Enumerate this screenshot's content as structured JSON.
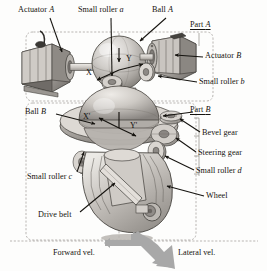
{
  "figure": {
    "type": "mechanical-assembly-diagram",
    "background_color": "#fdfdfc",
    "line_color": "#15130f"
  },
  "labels": {
    "actuator_a": {
      "text": "Actuator ",
      "em": "A",
      "x": 18,
      "y": 6
    },
    "small_roller_a": {
      "text": "Small roller ",
      "em": "a",
      "x": 78,
      "y": 6
    },
    "ball_a": {
      "text": "Ball ",
      "em": "A",
      "x": 152,
      "y": 6
    },
    "part_a": {
      "text": "Part ",
      "em": "A",
      "x": 190,
      "y": 25
    },
    "actuator_b": {
      "text": "Actuator ",
      "em": "B",
      "x": 205,
      "y": 54
    },
    "small_roller_b": {
      "text": "Small roller ",
      "em": "b",
      "x": 199,
      "y": 80
    },
    "ball_b": {
      "text": "Ball ",
      "em": "B",
      "x": 25,
      "y": 110
    },
    "part_b": {
      "text": "Part ",
      "em": "B",
      "x": 190,
      "y": 110
    },
    "bevel_gear": {
      "text": "Bevel gear",
      "em": "",
      "x": 202,
      "y": 133
    },
    "steering_gear": {
      "text": "Steering gear",
      "em": "",
      "x": 198,
      "y": 153
    },
    "small_roller_c": {
      "text": "Small roller ",
      "em": "c",
      "x": 27,
      "y": 176
    },
    "small_roller_d": {
      "text": "Small roller ",
      "em": "d",
      "x": 196,
      "y": 171
    },
    "drive_belt": {
      "text": "Drive belt",
      "em": "",
      "x": 38,
      "y": 214
    },
    "wheel": {
      "text": "Wheel",
      "em": "",
      "x": 206,
      "y": 196
    }
  },
  "axes": {
    "ball_a_x": {
      "text": "X",
      "x": 86,
      "y": 73
    },
    "ball_a_y": {
      "text": "Y",
      "x": 125,
      "y": 61
    },
    "ball_b_x": {
      "text": "X'",
      "x": 84,
      "y": 117
    },
    "ball_b_y": {
      "text": "Y'",
      "x": 129,
      "y": 124
    }
  },
  "velocity": {
    "forward": {
      "text": "Forward vel.",
      "x": 53,
      "y": 250
    },
    "lateral": {
      "text": "Lateral vel.",
      "x": 178,
      "y": 250
    },
    "arrow_color": "#a8a8a8"
  },
  "parts_regions": {
    "part_a_region": "upper dashed rounded rectangle",
    "part_b_region": "lower dashed rounded rectangle"
  }
}
